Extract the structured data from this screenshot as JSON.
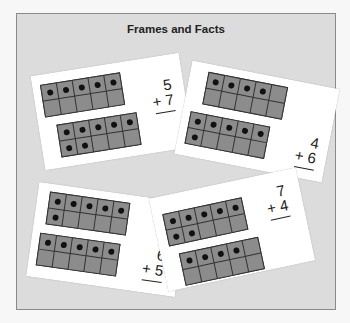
{
  "title": "Frames and Facts",
  "colors": {
    "panel": "#dcdcdc",
    "card": "#ffffff",
    "cell": "#8c8c8c",
    "dot": "#111111"
  },
  "cards": [
    {
      "top": 5,
      "bottom": 7,
      "addend1": "5",
      "addend2": "+ 7"
    },
    {
      "top": 4,
      "bottom": 6,
      "addend1": "4",
      "addend2": "+ 6"
    },
    {
      "top": 6,
      "bottom": 5,
      "addend1": "6",
      "addend2": "+ 5"
    },
    {
      "top": 7,
      "bottom": 4,
      "addend1": "7",
      "addend2": "+ 4"
    }
  ]
}
